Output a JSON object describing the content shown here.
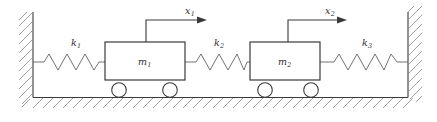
{
  "diagram": {
    "kind": "mass-spring-system",
    "background_color": "#ffffff",
    "line_color": "#3a3a3a",
    "hatch_color": "#8a8a8a",
    "masses": [
      {
        "id": "mass-1",
        "label": "m",
        "subscript": "1"
      },
      {
        "id": "mass-2",
        "label": "m",
        "subscript": "2"
      }
    ],
    "springs": [
      {
        "id": "spring-1",
        "label": "k",
        "subscript": "1"
      },
      {
        "id": "spring-2",
        "label": "k",
        "subscript": "2"
      },
      {
        "id": "spring-3",
        "label": "k",
        "subscript": "3"
      }
    ],
    "displacements": [
      {
        "id": "displacement-1",
        "label": "x",
        "subscript": "1",
        "direction": "right"
      },
      {
        "id": "displacement-2",
        "label": "x",
        "subscript": "2",
        "direction": "right"
      }
    ],
    "supports": [
      {
        "id": "wall-left",
        "name": "left-wall"
      },
      {
        "id": "wall-right",
        "name": "right-wall"
      },
      {
        "id": "ground",
        "name": "ground-surface"
      }
    ],
    "wheels": [
      {
        "id": "wheel-1"
      },
      {
        "id": "wheel-2"
      },
      {
        "id": "wheel-3"
      },
      {
        "id": "wheel-4"
      }
    ]
  }
}
